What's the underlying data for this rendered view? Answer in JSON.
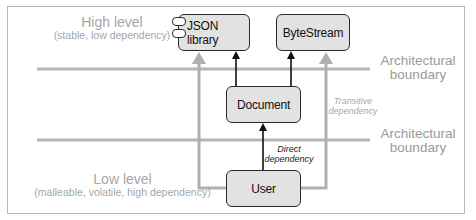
{
  "levels": {
    "high": {
      "title": "High level",
      "subtitle": "(stable, low dependency)"
    },
    "low": {
      "title": "Low level",
      "subtitle": "(malleable, volatile, high dependency)"
    }
  },
  "boundaries": [
    {
      "line1": "Architectural",
      "line2": "boundary"
    },
    {
      "line1": "Architectural",
      "line2": "boundary"
    }
  ],
  "nodes": {
    "json_library": {
      "label": "JSON library",
      "icon": "component-icon"
    },
    "bytestream": {
      "label": "ByteStream"
    },
    "document": {
      "label": "Document"
    },
    "user": {
      "label": "User"
    }
  },
  "annotations": {
    "direct": {
      "line1": "Direct",
      "line2": "dependency"
    },
    "transitive": {
      "line1": "Transitive",
      "line2": "dependency"
    }
  },
  "edges": [
    {
      "from": "Document",
      "to": "JSON library",
      "type": "direct"
    },
    {
      "from": "Document",
      "to": "ByteStream",
      "type": "direct"
    },
    {
      "from": "User",
      "to": "Document",
      "type": "direct"
    },
    {
      "from": "User",
      "to": "JSON library",
      "type": "transitive"
    },
    {
      "from": "User",
      "to": "ByteStream",
      "type": "transitive"
    }
  ],
  "colors": {
    "node_fill": "#e2e2e2",
    "node_border": "#2a2a2a",
    "direct_arrow": "#111111",
    "transitive_arrow": "#b0b0b0",
    "boundary_line": "#b5b5b5",
    "label_gray": "#a6a6a6"
  }
}
